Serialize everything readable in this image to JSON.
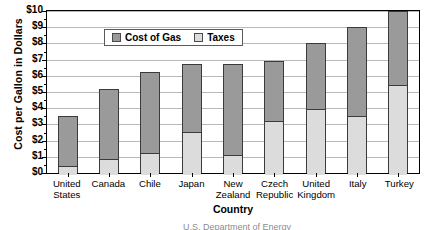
{
  "chart_data": {
    "type": "bar",
    "stacked": true,
    "title": "",
    "xlabel": "Country",
    "ylabel": "Cost per Gallon in Dollars",
    "categories": [
      "United States",
      "Canada",
      "Chile",
      "Japan",
      "New Zealand",
      "Czech Republic",
      "United Kingdom",
      "Italy",
      "Turkey"
    ],
    "category_lines": [
      [
        "United",
        "States"
      ],
      [
        "Canada",
        ""
      ],
      [
        "Chile",
        ""
      ],
      [
        "Japan",
        ""
      ],
      [
        "New",
        "Zealand"
      ],
      [
        "Czech",
        "Republic"
      ],
      [
        "United",
        "Kingdom"
      ],
      [
        "Italy",
        ""
      ],
      [
        "Turkey",
        ""
      ]
    ],
    "series": [
      {
        "name": "Taxes",
        "values": [
          0.5,
          0.95,
          1.3,
          2.6,
          1.2,
          3.3,
          4.0,
          3.6,
          5.5
        ]
      },
      {
        "name": "Cost of Gas",
        "values": [
          3.0,
          4.25,
          4.95,
          4.1,
          5.5,
          3.6,
          4.0,
          5.4,
          4.5
        ]
      }
    ],
    "totals": [
      3.5,
      5.2,
      6.25,
      6.7,
      6.7,
      6.9,
      8.0,
      9.0,
      10.0
    ],
    "ylim": [
      0,
      10
    ],
    "ytick_step": 1,
    "yticks": [
      "$0",
      "$1",
      "$2",
      "$3",
      "$4",
      "$5",
      "$6",
      "$7",
      "$8",
      "$9",
      "$10"
    ],
    "grid": true,
    "legend_position": "top-left",
    "legend": [
      "Cost of Gas",
      "Taxes"
    ],
    "colors": {
      "cost_of_gas": "#9a9a9a",
      "taxes": "#dcdcdc",
      "bar_outline": "#3b3b3b",
      "gridline": "#b9b9b9",
      "axis": "#000000"
    }
  },
  "source": {
    "left": "",
    "right": "U.S. Department of Energy"
  }
}
